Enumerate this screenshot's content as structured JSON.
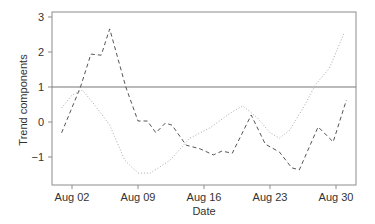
{
  "chart_data": {
    "type": "line",
    "title": "",
    "xlabel": "Date",
    "ylabel": "Trend components",
    "x_ticks": [
      "Aug 02",
      "Aug 09",
      "Aug 16",
      "Aug 23",
      "Aug 30"
    ],
    "y_ticks": [
      "3",
      "2",
      "1",
      "0",
      "−1"
    ],
    "y_tick_values": [
      3,
      2,
      1,
      0,
      -1
    ],
    "ylim": [
      -1.8,
      3.2
    ],
    "xlim_days_from_aug02": [
      -2.1,
      30.1
    ],
    "grid": false,
    "legend": null,
    "reference_line": {
      "y": 1,
      "style": "solid",
      "color": "#777777"
    },
    "series": [
      {
        "name": "dashed component",
        "style": "dashed",
        "color": "#555555",
        "points": [
          {
            "x": "Jul 31",
            "day": -1.1,
            "y": -0.31
          },
          {
            "x": "Aug 02",
            "day": 0.9,
            "y": 1.0
          },
          {
            "x": "Aug 04",
            "day": 2.0,
            "y": 1.94
          },
          {
            "x": "Aug 05",
            "day": 3.1,
            "y": 1.91
          },
          {
            "x": "Aug 06",
            "day": 4.0,
            "y": 2.66
          },
          {
            "x": "Aug 07",
            "day": 5.7,
            "y": 1.0
          },
          {
            "x": "Aug 09",
            "day": 7.0,
            "y": 0.03
          },
          {
            "x": "Aug 10",
            "day": 8.0,
            "y": 0.03
          },
          {
            "x": "Aug 10",
            "day": 8.9,
            "y": -0.31
          },
          {
            "x": "Aug 11",
            "day": 9.9,
            "y": -0.03
          },
          {
            "x": "Aug 12",
            "day": 10.6,
            "y": -0.09
          },
          {
            "x": "Aug 14",
            "day": 12.1,
            "y": -0.66
          },
          {
            "x": "Aug 15",
            "day": 13.6,
            "y": -0.77
          },
          {
            "x": "Aug 17",
            "day": 15.0,
            "y": -0.94
          },
          {
            "x": "Aug 17",
            "day": 15.9,
            "y": -0.83
          },
          {
            "x": "Aug 19",
            "day": 17.0,
            "y": -0.89
          },
          {
            "x": "Aug 21",
            "day": 19.0,
            "y": 0.2
          },
          {
            "x": "Aug 22",
            "day": 20.5,
            "y": -0.63
          },
          {
            "x": "Aug 24",
            "day": 22.0,
            "y": -0.86
          },
          {
            "x": "Aug 25",
            "day": 23.3,
            "y": -1.31
          },
          {
            "x": "Aug 26",
            "day": 24.1,
            "y": -1.37
          },
          {
            "x": "Aug 28",
            "day": 26.1,
            "y": -0.14
          },
          {
            "x": "Aug 29",
            "day": 27.7,
            "y": -0.57
          },
          {
            "x": "Aug 31",
            "day": 29.1,
            "y": 0.63
          }
        ]
      },
      {
        "name": "dotted component",
        "style": "dotted",
        "color": "#aaaaaa",
        "points": [
          {
            "x": "Jul 31",
            "day": -1.1,
            "y": 0.4
          },
          {
            "x": "Aug 02",
            "day": 0.0,
            "y": 0.77
          },
          {
            "x": "Aug 03",
            "day": 1.1,
            "y": 0.91
          },
          {
            "x": "Aug 04",
            "day": 2.4,
            "y": 0.49
          },
          {
            "x": "Aug 06",
            "day": 4.0,
            "y": -0.09
          },
          {
            "x": "Aug 07",
            "day": 5.6,
            "y": -1.09
          },
          {
            "x": "Aug 09",
            "day": 7.0,
            "y": -1.46
          },
          {
            "x": "Aug 10",
            "day": 8.3,
            "y": -1.46
          },
          {
            "x": "Aug 12",
            "day": 10.4,
            "y": -1.09
          },
          {
            "x": "Aug 14",
            "day": 12.5,
            "y": -0.46
          },
          {
            "x": "Aug 16",
            "day": 14.6,
            "y": -0.17
          },
          {
            "x": "Aug 19",
            "day": 17.0,
            "y": 0.29
          },
          {
            "x": "Aug 20",
            "day": 18.1,
            "y": 0.46
          },
          {
            "x": "Aug 21",
            "day": 19.7,
            "y": 0.11
          },
          {
            "x": "Aug 23",
            "day": 21.0,
            "y": -0.31
          },
          {
            "x": "Aug 24",
            "day": 22.0,
            "y": -0.46
          },
          {
            "x": "Aug 25",
            "day": 23.1,
            "y": -0.23
          },
          {
            "x": "Aug 26",
            "day": 24.7,
            "y": 0.49
          },
          {
            "x": "Aug 27",
            "day": 25.8,
            "y": 1.06
          },
          {
            "x": "Aug 29",
            "day": 27.3,
            "y": 1.54
          },
          {
            "x": "Aug 31",
            "day": 28.9,
            "y": 2.57
          }
        ]
      }
    ]
  },
  "axes": {
    "x_title": "Date",
    "y_title": "Trend components",
    "x_tick_labels": [
      "Aug 02",
      "Aug 09",
      "Aug 16",
      "Aug 23",
      "Aug 30"
    ],
    "y_tick_labels": [
      "3",
      "2",
      "1",
      "0",
      "−1"
    ]
  }
}
